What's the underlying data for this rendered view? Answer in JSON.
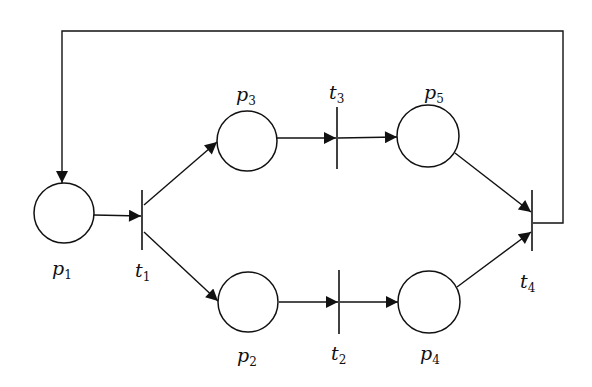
{
  "diagram": {
    "type": "petri-net",
    "places": [
      {
        "id": "p1",
        "name": "p",
        "sub": "1",
        "cx": 64,
        "cy": 213
      },
      {
        "id": "p2",
        "name": "p",
        "sub": "2",
        "cx": 248,
        "cy": 302
      },
      {
        "id": "p3",
        "name": "p",
        "sub": "3",
        "cx": 247,
        "cy": 141
      },
      {
        "id": "p4",
        "name": "p",
        "sub": "4",
        "cx": 429,
        "cy": 302
      },
      {
        "id": "p5",
        "name": "p",
        "sub": "5",
        "cx": 428,
        "cy": 136
      }
    ],
    "transitions": [
      {
        "id": "t1",
        "name": "t",
        "sub": "1"
      },
      {
        "id": "t2",
        "name": "t",
        "sub": "2"
      },
      {
        "id": "t3",
        "name": "t",
        "sub": "3"
      },
      {
        "id": "t4",
        "name": "t",
        "sub": "4"
      }
    ],
    "arcs": [
      {
        "from": "p1",
        "to": "t1"
      },
      {
        "from": "t1",
        "to": "p3"
      },
      {
        "from": "t1",
        "to": "p2"
      },
      {
        "from": "p3",
        "to": "t3"
      },
      {
        "from": "t3",
        "to": "p5"
      },
      {
        "from": "p2",
        "to": "t2"
      },
      {
        "from": "t2",
        "to": "p4"
      },
      {
        "from": "p5",
        "to": "t4"
      },
      {
        "from": "p4",
        "to": "t4"
      },
      {
        "from": "t4",
        "to": "p1"
      }
    ],
    "colors": {
      "stroke": "#111111",
      "background": "#ffffff"
    }
  }
}
